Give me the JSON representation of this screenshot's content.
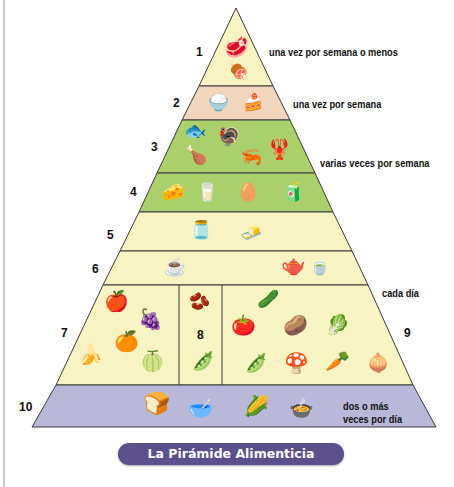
{
  "title": "La Pirámide Alimenticia Latinoamericana",
  "colors": {
    "tier_cream": "#f7f3c2",
    "tier_pink": "#f1d5bd",
    "tier_green": "#a9d06a",
    "tier_lavender": "#b9b8d9",
    "outline": "#3a3a3a",
    "title_bg": "#5b4f8c"
  },
  "tiers": [
    {
      "number": "1",
      "frequency": "una vez por semana o menos",
      "foods": [
        "steak-icon",
        "meat-icon"
      ]
    },
    {
      "number": "2",
      "frequency": "una vez por semana",
      "foods": [
        "sugar-bowl-icon",
        "cake-icon"
      ]
    },
    {
      "number": "3",
      "frequency": "varias veces por semana",
      "foods": [
        "fish-icon",
        "roast-chicken-icon",
        "chicken-leg-icon",
        "shrimp-icon",
        "lobster-icon"
      ]
    },
    {
      "number": "4",
      "frequency": "",
      "foods": [
        "cheese-icon",
        "yogurt-icon",
        "eggs-icon",
        "milk-carton-icon"
      ]
    },
    {
      "number": "5",
      "frequency": "",
      "foods": [
        "oil-bottle-icon",
        "butter-icon"
      ]
    },
    {
      "number": "6",
      "frequency": "",
      "foods": [
        "coffee-cup-icon",
        "teapot-icon",
        "teacup-icon"
      ]
    },
    {
      "number": "7",
      "frequency": "",
      "foods": [
        "apple-icon",
        "grapes-icon",
        "orange-icon",
        "banana-icon",
        "melon-icon"
      ]
    },
    {
      "number": "8",
      "frequency": "",
      "foods": [
        "beans-icon",
        "green-beans-icon"
      ]
    },
    {
      "number": "9",
      "frequency": "",
      "foods": [
        "cucumber-icon",
        "tomato-icon",
        "potato-icon",
        "cabbage-icon",
        "peas-icon",
        "mushroom-icon",
        "carrot-icon",
        "onion-icon"
      ]
    },
    {
      "number": "10",
      "frequency": "dos o más veces por día",
      "foods": [
        "bread-icon",
        "cereal-bowl-icon",
        "corn-icon",
        "rice-bowl-icon"
      ]
    }
  ],
  "shared_labels": {
    "daily": "cada día",
    "twice_line1": "dos o más",
    "twice_line2": "veces por día"
  },
  "glyphs": {
    "steak": "🥩",
    "meat": "🍖",
    "sugar": "🍚",
    "cake": "🍰",
    "fish": "🐟",
    "chicken": "🍗",
    "roast": "🦃",
    "shrimp": "🦐",
    "lobster": "🦞",
    "cheese": "🧀",
    "yogurt": "🥛",
    "eggs": "🥚",
    "milk": "🧃",
    "oil": "🫙",
    "butter": "🧈",
    "coffee": "☕",
    "teapot": "🫖",
    "teacup": "🍵",
    "apple": "🍎",
    "grapes": "🍇",
    "orange": "🍊",
    "banana": "🍌",
    "melon": "🍈",
    "beans": "🫘",
    "greenbeans": "🫛",
    "cucumber": "🥒",
    "tomato": "🍅",
    "potato": "🥔",
    "cabbage": "🥬",
    "peas": "🫛",
    "mushroom": "🍄",
    "carrot": "🥕",
    "onion": "🧅",
    "bread": "🍞",
    "cereal": "🥣",
    "corn": "🌽",
    "rice": "🍲"
  }
}
